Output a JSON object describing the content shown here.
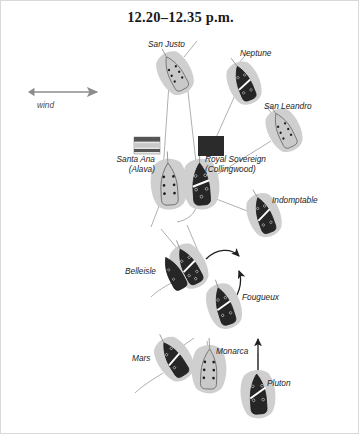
{
  "figure": {
    "title": "12.20–12.35 p.m.",
    "kind": "naval-battle-diagram",
    "background_color": "#ffffff",
    "border_color": "#d9d9d9"
  },
  "wind": {
    "label": "wind",
    "direction": "east",
    "color": "#8c8c8c"
  },
  "palette": {
    "british_hull": "#262626",
    "allied_hull": "#c9c9c9",
    "hull_outline": "#555555",
    "wake": "#cfcfcf",
    "track_line": "#9a9a9a",
    "arrow": "#1f1f1f",
    "text": "#1c1c1c"
  },
  "flags": [
    {
      "name": "santa-ana-flag",
      "fleet": "allied",
      "style": "horizontal-bands",
      "bands": [
        "#555555",
        "#c9c9c9",
        "#555555",
        "#e6e6e6"
      ],
      "x": 133,
      "y": 136,
      "width": 26,
      "height": 17
    },
    {
      "name": "royal-sovereign-flag",
      "fleet": "british",
      "style": "solid",
      "bands": [
        "#2b2b2b"
      ],
      "x": 197,
      "y": 135,
      "width": 26,
      "height": 20
    }
  ],
  "ships": [
    {
      "id": "san-justo",
      "label": "San Justo",
      "fleet": "allied",
      "label_x": 147,
      "label_y": 38,
      "x": 174,
      "y": 72,
      "rotation": -28,
      "gunports": 6
    },
    {
      "id": "neptune",
      "label": "Neptune",
      "fleet": "british",
      "label_x": 239,
      "label_y": 47,
      "x": 243,
      "y": 82,
      "rotation": -22,
      "gunports": 4
    },
    {
      "id": "san-leandro",
      "label": "San Leandro",
      "fleet": "allied",
      "label_x": 263,
      "label_y": 100,
      "x": 283,
      "y": 129,
      "rotation": -26,
      "gunports": 6
    },
    {
      "id": "santa-ana",
      "label": "Santa Ana",
      "label2": "(Alava)",
      "fleet": "allied",
      "label_x": 104,
      "label_y": 154,
      "x": 168,
      "y": 183,
      "rotation": -3,
      "gunports": 6
    },
    {
      "id": "royal-sovereign",
      "label": "Royal Sovereign",
      "label2": "(Collingwood)",
      "fleet": "british",
      "label_x": 204,
      "label_y": 153,
      "x": 200,
      "y": 183,
      "rotation": -4,
      "gunports": 5
    },
    {
      "id": "indomptable",
      "label": "Indomptable",
      "fleet": "british",
      "label_x": 271,
      "label_y": 194,
      "x": 263,
      "y": 214,
      "rotation": -20,
      "gunports": 4
    },
    {
      "id": "belleisle",
      "label": "Belleisle",
      "fleet": "british",
      "label_x": 131,
      "label_y": 266,
      "x": 188,
      "y": 265,
      "rotation": -28,
      "gunports": 5
    },
    {
      "id": "fougueux",
      "label": "Fougueux",
      "fleet": "british",
      "label_x": 241,
      "label_y": 293,
      "x": 223,
      "y": 305,
      "rotation": -18,
      "gunports": 4
    },
    {
      "id": "mars",
      "label": "Mars",
      "fleet": "british",
      "label_x": 134,
      "label_y": 353,
      "x": 173,
      "y": 358,
      "rotation": -32,
      "gunports": 3
    },
    {
      "id": "monarca",
      "label": "Monarca",
      "fleet": "allied",
      "label_x": 215,
      "label_y": 348,
      "x": 208,
      "y": 368,
      "rotation": 2,
      "gunports": 6
    },
    {
      "id": "pluton",
      "label": "Pluton",
      "fleet": "british",
      "label_x": 266,
      "label_y": 379,
      "x": 257,
      "y": 393,
      "rotation": -4,
      "gunports": 4
    }
  ],
  "arrows": [
    {
      "name": "wind-arrow",
      "kind": "straight"
    },
    {
      "name": "belleisle-turn-arrow",
      "kind": "curved"
    },
    {
      "name": "fougueux-turn-arrow",
      "kind": "curved"
    },
    {
      "name": "pluton-course-arrow",
      "kind": "straight"
    }
  ]
}
